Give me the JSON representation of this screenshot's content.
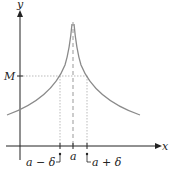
{
  "diagram": {
    "axes": {
      "x_label": "x",
      "y_label": "y"
    },
    "labels": {
      "M": "M",
      "a": "a",
      "a_minus_delta": "a − δ",
      "a_plus_delta": "a + δ"
    },
    "colors": {
      "curve": "#8a8a8a",
      "axis": "#222222",
      "guide": "#aaaaaa"
    }
  }
}
